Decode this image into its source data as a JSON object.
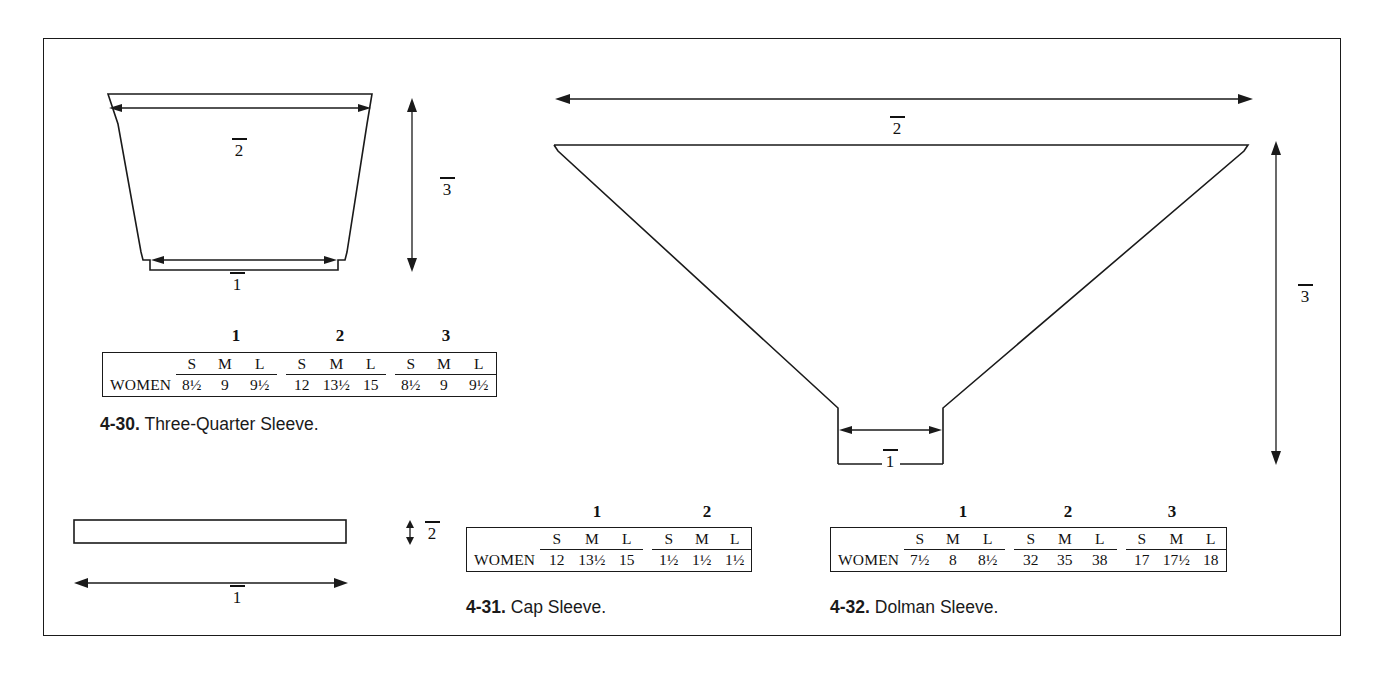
{
  "page": {
    "border_color": "#1a1a1a",
    "background": "#ffffff"
  },
  "figures": [
    {
      "id": "three-quarter-sleeve",
      "number": "4-30.",
      "title": "Three-Quarter Sleeve.",
      "dimension_labels": [
        "1",
        "2",
        "3"
      ],
      "table": {
        "row_label": "WOMEN",
        "group_headings": [
          "1",
          "2",
          "3"
        ],
        "size_headers": [
          "S",
          "M",
          "L"
        ],
        "groups": [
          {
            "heading": "1",
            "values": [
              "8½",
              "9",
              "9½"
            ]
          },
          {
            "heading": "2",
            "values": [
              "12",
              "13½",
              "15"
            ]
          },
          {
            "heading": "3",
            "values": [
              "8½",
              "9",
              "9½"
            ]
          }
        ]
      }
    },
    {
      "id": "cap-sleeve",
      "number": "4-31.",
      "title": "Cap Sleeve.",
      "dimension_labels": [
        "1",
        "2"
      ],
      "table": {
        "row_label": "WOMEN",
        "group_headings": [
          "1",
          "2"
        ],
        "size_headers": [
          "S",
          "M",
          "L"
        ],
        "groups": [
          {
            "heading": "1",
            "values": [
              "12",
              "13½",
              "15"
            ]
          },
          {
            "heading": "2",
            "values": [
              "1½",
              "1½",
              "1½"
            ]
          }
        ]
      }
    },
    {
      "id": "dolman-sleeve",
      "number": "4-32.",
      "title": "Dolman Sleeve.",
      "dimension_labels": [
        "1",
        "2",
        "3"
      ],
      "table": {
        "row_label": "WOMEN",
        "group_headings": [
          "1",
          "2",
          "3"
        ],
        "size_headers": [
          "S",
          "M",
          "L"
        ],
        "groups": [
          {
            "heading": "1",
            "values": [
              "7½",
              "8",
              "8½"
            ]
          },
          {
            "heading": "2",
            "values": [
              "32",
              "35",
              "38"
            ]
          },
          {
            "heading": "3",
            "values": [
              "17",
              "17½",
              "18"
            ]
          }
        ]
      }
    }
  ]
}
